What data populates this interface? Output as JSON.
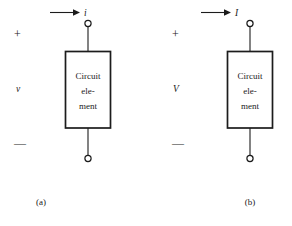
{
  "figure": {
    "background_color": "#ffffff",
    "ink_color": "#1c1c1c",
    "panels": [
      {
        "id": "a",
        "caption": "(a)",
        "current_label": "i",
        "voltage_label": "v",
        "plus_sign": "+",
        "minus_sign": "—",
        "box_lines": [
          "Circuit",
          "ele-",
          "ment"
        ],
        "arrow_direction": "right"
      },
      {
        "id": "b",
        "caption": "(b)",
        "current_label": "I",
        "voltage_label": "V",
        "plus_sign": "+",
        "minus_sign": "—",
        "box_lines": [
          "Circuit",
          "ele-",
          "ment"
        ],
        "arrow_direction": "right"
      }
    ]
  },
  "panel_a": {
    "caption": "(a)",
    "current_label": "i",
    "voltage_label": "v",
    "plus_sign": "+",
    "minus_sign": "—",
    "box_line_1": "Circuit",
    "box_line_2": "ele-",
    "box_line_3": "ment"
  },
  "panel_b": {
    "caption": "(b)",
    "current_label": "I",
    "voltage_label": "V",
    "plus_sign": "+",
    "minus_sign": "—",
    "box_line_1": "Circuit",
    "box_line_2": "ele-",
    "box_line_3": "ment"
  }
}
